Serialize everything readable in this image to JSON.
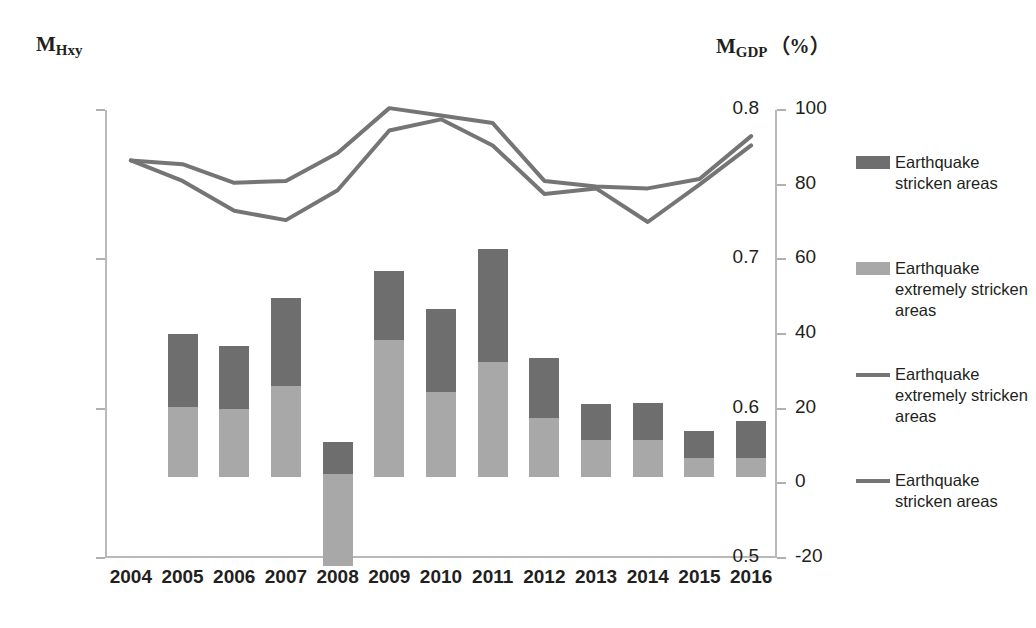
{
  "axes": {
    "left_title_main": "M",
    "left_title_sub": "Hxy",
    "right_title_main": "M",
    "right_title_sub": "GDP",
    "right_title_unit": "（%）"
  },
  "legend": {
    "items": [
      {
        "label": "Earthquake stricken areas",
        "type": "box",
        "color": "#6e6e6e"
      },
      {
        "label": "Earthquake extremely stricken areas",
        "type": "box",
        "color": "#a8a8a8"
      },
      {
        "label": "Earthquake extremely stricken areas",
        "type": "line",
        "color": "#757575"
      },
      {
        "label": "Earthquake stricken areas",
        "type": "line",
        "color": "#757575"
      }
    ]
  },
  "chart_data": {
    "type": "bar",
    "title": "",
    "xlabel": "",
    "ylabel": "M_Hxy",
    "y2label": "M_GDP (%)",
    "grid": false,
    "legend_position": "right",
    "stacked": true,
    "categories": [
      "2004",
      "2005",
      "2006",
      "2007",
      "2008",
      "2009",
      "2010",
      "2011",
      "2012",
      "2013",
      "2014",
      "2015",
      "2016"
    ],
    "ylim": [
      0.5,
      0.8
    ],
    "yticks": [
      "0.5",
      "0.6",
      "0.7",
      "0.8"
    ],
    "ytick_values": [
      0.5,
      0.6,
      0.7,
      0.8
    ],
    "y2lim": [
      -20,
      100
    ],
    "y2ticks": [
      "-20",
      "0",
      "20",
      "40",
      "60",
      "80",
      "100"
    ],
    "y2tick_values": [
      -20,
      0,
      20,
      40,
      60,
      80,
      100
    ],
    "series": [
      {
        "name": "Earthquake extremely stricken areas",
        "kind": "bar-segment",
        "axis": "left",
        "color": "#a8a8a8",
        "base_values": [
          null,
          0.554,
          0.554,
          0.554,
          0.486,
          0.554,
          0.554,
          0.554,
          0.554,
          0.554,
          0.554,
          0.554,
          0.554
        ],
        "top_values": [
          null,
          0.601,
          0.6,
          0.615,
          0.556,
          0.646,
          0.611,
          0.631,
          0.594,
          0.579,
          0.579,
          0.567,
          0.567
        ]
      },
      {
        "name": "Earthquake stricken areas",
        "kind": "bar-segment",
        "axis": "left",
        "color": "#6e6e6e",
        "base_values": [
          null,
          0.601,
          0.6,
          0.615,
          0.556,
          0.646,
          0.611,
          0.631,
          0.594,
          0.579,
          0.579,
          0.567,
          0.567
        ],
        "top_values": [
          null,
          0.65,
          0.642,
          0.674,
          0.578,
          0.692,
          0.667,
          0.707,
          0.634,
          0.603,
          0.604,
          0.585,
          0.592
        ]
      },
      {
        "name": "Earthquake extremely stricken areas",
        "kind": "line",
        "axis": "right",
        "color": "#757575",
        "values": [
          86.5,
          85.5,
          80.5,
          81.0,
          88.5,
          100.5,
          98.5,
          96.5,
          81.0,
          79.5,
          79.0,
          81.5,
          93.0
        ]
      },
      {
        "name": "Earthquake stricken areas",
        "kind": "line",
        "axis": "right",
        "color": "#757575",
        "values": [
          86.5,
          81.0,
          73.0,
          70.5,
          78.5,
          94.5,
          97.5,
          90.5,
          77.5,
          79.0,
          70.0,
          80.0,
          90.5
        ]
      }
    ]
  }
}
